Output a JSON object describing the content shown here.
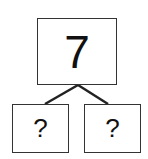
{
  "diagram": {
    "type": "number-bond",
    "whole": "7",
    "parts": [
      "?",
      "?"
    ],
    "colors": {
      "stroke": "#333333",
      "text": "#111111",
      "background": "#ffffff"
    }
  }
}
